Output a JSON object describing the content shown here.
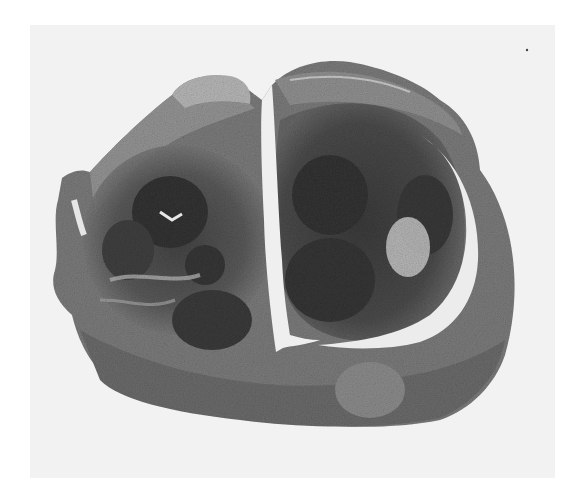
{
  "image": {
    "description": "Low-magnification grayscale histological section of an oval tissue specimen with a central vertical cleft separating two nodular lobes; the right lobe is outlined by a crescent-shaped cleft",
    "background_color": "#f2f2f2",
    "page_color": "#ffffff",
    "tissue_dark": "#3a3a3a",
    "tissue_mid": "#6e6e6e",
    "tissue_light": "#a8a8a8",
    "cleft_color": "#f0f0f0"
  }
}
